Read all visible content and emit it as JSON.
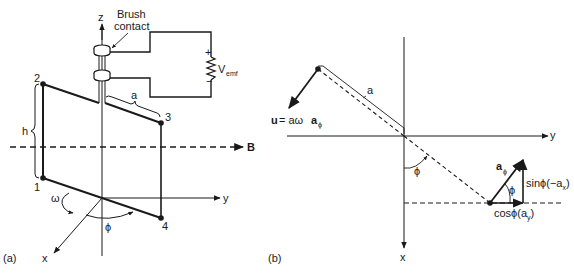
{
  "figure_a": {
    "panel_label": "(a)",
    "axis_z": "z",
    "axis_y": "y",
    "axis_x": "x",
    "brush_label_line1": "Brush",
    "brush_label_line2": "contact",
    "vemf_main": "V",
    "vemf_sub": "emf",
    "plus": "+",
    "minus": "−",
    "corner_1": "1",
    "corner_2": "2",
    "corner_3": "3",
    "corner_4": "4",
    "dim_h": "h",
    "dim_a": "a",
    "omega": "ω",
    "phi": "ϕ",
    "field_label": "B"
  },
  "figure_b": {
    "panel_label": "(b)",
    "axis_y": "y",
    "axis_x": "x",
    "dim_a": "a",
    "velocity_u": "u",
    "velocity_eq": " = aω",
    "velocity_vec": "a",
    "velocity_sub": "ϕ",
    "phi_angle": "ϕ",
    "aphi_main": "a",
    "aphi_sub": "ϕ",
    "triangle_phi": "ϕ",
    "sin_label_pre": "sinϕ(−a",
    "sin_label_sub": "x",
    "sin_label_post": ")",
    "cos_label_pre": "cosϕ(a",
    "cos_label_sub": "y",
    "cos_label_post": ")"
  }
}
